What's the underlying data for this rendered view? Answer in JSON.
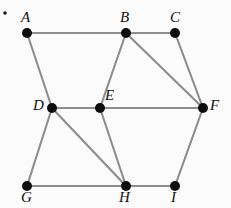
{
  "figure": {
    "type": "undirected-graph",
    "background_color": "#fbfbfb",
    "edge_color": "#8d8d8d",
    "vertex_color": "#0d0d0d",
    "label_color": "#111111",
    "bullet_marker": "•"
  },
  "graph_data": {
    "type": "diagram",
    "vertices": [
      {
        "id": "A",
        "label": "A",
        "x": 27,
        "y": 33,
        "label_x": 21,
        "label_y": 10,
        "r": 5.0
      },
      {
        "id": "B",
        "label": "B",
        "x": 126,
        "y": 33,
        "label_x": 120,
        "label_y": 10,
        "r": 5.0
      },
      {
        "id": "C",
        "label": "C",
        "x": 175,
        "y": 33,
        "label_x": 170,
        "label_y": 10,
        "r": 5.0
      },
      {
        "id": "D",
        "label": "D",
        "x": 52,
        "y": 108,
        "label_x": 33,
        "label_y": 98,
        "r": 5.0
      },
      {
        "id": "E",
        "label": "E",
        "x": 100,
        "y": 108,
        "label_x": 105,
        "label_y": 88,
        "r": 5.0
      },
      {
        "id": "F",
        "label": "F",
        "x": 203,
        "y": 108,
        "label_x": 210,
        "label_y": 98,
        "r": 5.0
      },
      {
        "id": "G",
        "label": "G",
        "x": 27,
        "y": 186,
        "label_x": 21,
        "label_y": 190,
        "r": 5.0
      },
      {
        "id": "H",
        "label": "H",
        "x": 126,
        "y": 186,
        "label_x": 119,
        "label_y": 190,
        "r": 5.0
      },
      {
        "id": "I",
        "label": "I",
        "x": 175,
        "y": 186,
        "label_x": 171,
        "label_y": 190,
        "r": 5.0
      }
    ],
    "edges": [
      {
        "from": "A",
        "to": "B"
      },
      {
        "from": "B",
        "to": "C"
      },
      {
        "from": "A",
        "to": "D"
      },
      {
        "from": "B",
        "to": "E"
      },
      {
        "from": "B",
        "to": "F"
      },
      {
        "from": "C",
        "to": "F"
      },
      {
        "from": "D",
        "to": "E"
      },
      {
        "from": "E",
        "to": "F"
      },
      {
        "from": "D",
        "to": "G"
      },
      {
        "from": "D",
        "to": "H"
      },
      {
        "from": "E",
        "to": "H"
      },
      {
        "from": "G",
        "to": "H"
      },
      {
        "from": "H",
        "to": "I"
      },
      {
        "from": "F",
        "to": "I"
      }
    ],
    "bullet": {
      "x": 5,
      "y": 13,
      "r": 1.8
    },
    "vertex_count": 9,
    "edge_count": 14
  }
}
